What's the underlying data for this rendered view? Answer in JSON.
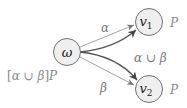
{
  "diagram": {
    "nodes": {
      "omega": {
        "label": "ω"
      },
      "v1": {
        "label": "v",
        "subscript": "1",
        "annotation": "P"
      },
      "v2": {
        "label": "v",
        "subscript": "2",
        "annotation": "P"
      }
    },
    "edges": {
      "alpha": {
        "from": "omega",
        "to": "v1",
        "label": "α"
      },
      "beta": {
        "from": "omega",
        "to": "v2",
        "label": "β"
      },
      "union": {
        "from": "omega",
        "to": [
          "v1",
          "v2"
        ],
        "label": "α ∪ β"
      }
    },
    "formula": {
      "bracket_open": "[",
      "alpha": "α",
      "union": " ∪ ",
      "beta": "β",
      "bracket_close": "]",
      "predicate": "P"
    },
    "colors": {
      "node_fill": "#efefef",
      "node_stroke": "#6f6f6f",
      "thin_edge": "#8a8a8a",
      "thick_edge": "#555555",
      "label_gray": "#8a8a8a"
    }
  }
}
